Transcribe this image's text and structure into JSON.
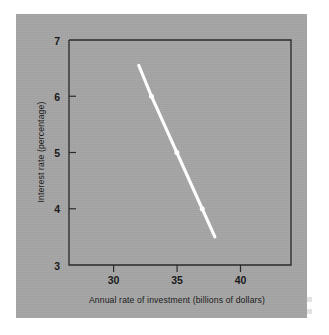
{
  "figure": {
    "background_color": "#ffffff",
    "panel_color": "#a5a5a5",
    "curve_color": "#ffffff",
    "axis_color": "#2b2b2b",
    "text_color": "#1a1a1a"
  },
  "chart_data": {
    "type": "line",
    "title": "",
    "subtitle": "",
    "xlabel": "Annual rate of investment (billions of dollars)",
    "ylabel": "Interest rate (percentage)",
    "xlim": [
      26.5,
      44
    ],
    "ylim": [
      3,
      7
    ],
    "xticks": [
      30,
      35,
      40
    ],
    "xtick_labels": [
      "30",
      "35",
      "40"
    ],
    "yticks": [
      3,
      4,
      5,
      6,
      7
    ],
    "ytick_labels": [
      "3",
      "4",
      "5",
      "6",
      "7"
    ],
    "grid": false,
    "legend": null,
    "legend_position": "none",
    "series": [
      {
        "name": "Investment demand",
        "x": [
          32.0,
          33.0,
          35.0,
          37.0,
          38.0
        ],
        "y": [
          6.55,
          6.0,
          5.0,
          4.0,
          3.5
        ],
        "marker_points": [
          {
            "x": 33.0,
            "y": 6.0
          },
          {
            "x": 35.0,
            "y": 5.0
          },
          {
            "x": 37.0,
            "y": 4.0
          }
        ],
        "color": "#ffffff",
        "line_width": 3.1
      }
    ],
    "annotations": []
  }
}
